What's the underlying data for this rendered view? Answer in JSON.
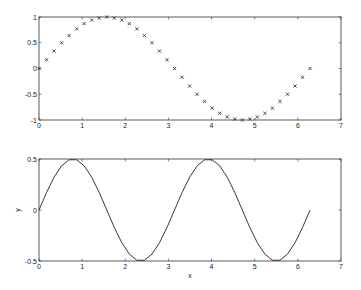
{
  "chart_data": [
    {
      "type": "scatter",
      "title": "",
      "xlabel": "",
      "ylabel": "",
      "xlim": [
        0,
        7
      ],
      "ylim": [
        -1,
        1
      ],
      "xticks": [
        "0",
        "1",
        "2",
        "3",
        "4",
        "5",
        "6",
        "7"
      ],
      "yticks": [
        "-1",
        "-0.5",
        "0",
        "0.5",
        "1"
      ],
      "marker": "x",
      "grid": false,
      "series": [
        {
          "name": "sin(x)",
          "x": [
            0,
            0.1745,
            0.3491,
            0.5236,
            0.6981,
            0.8727,
            1.0472,
            1.2217,
            1.3963,
            1.5708,
            1.7453,
            1.9199,
            2.0944,
            2.2689,
            2.4435,
            2.618,
            2.7925,
            2.9671,
            3.1416,
            3.3161,
            3.4907,
            3.6652,
            3.8397,
            4.0143,
            4.1888,
            4.3633,
            4.5379,
            4.7124,
            4.8869,
            5.0615,
            5.236,
            5.4105,
            5.5851,
            5.7596,
            5.9341,
            6.1087,
            6.2832
          ],
          "y": [
            0,
            0.17,
            0.34,
            0.5,
            0.64,
            0.77,
            0.87,
            0.94,
            0.98,
            1,
            0.98,
            0.94,
            0.87,
            0.77,
            0.64,
            0.5,
            0.34,
            0.17,
            0,
            -0.17,
            -0.34,
            -0.5,
            -0.64,
            -0.77,
            -0.87,
            -0.94,
            -0.98,
            -1,
            -0.98,
            -0.94,
            -0.87,
            -0.77,
            -0.64,
            -0.5,
            -0.34,
            -0.17,
            0
          ]
        }
      ]
    },
    {
      "type": "line",
      "title": "",
      "xlabel": "x",
      "ylabel": "y",
      "xlim": [
        0,
        7
      ],
      "ylim": [
        -0.5,
        0.5
      ],
      "xticks": [
        "0",
        "1",
        "2",
        "3",
        "4",
        "5",
        "6",
        "7"
      ],
      "yticks": [
        "-0.5",
        "0",
        "0.5"
      ],
      "grid": false,
      "series": [
        {
          "name": "0.5*sin(2x)",
          "x_range": [
            0,
            6.2832
          ],
          "points": 37,
          "function": "0.5*sin(2x)"
        }
      ]
    }
  ],
  "labels": {
    "top_xticks": [
      "0",
      "1",
      "2",
      "3",
      "4",
      "5",
      "6",
      "7"
    ],
    "top_yticks": [
      "-1",
      "-0.5",
      "0",
      "0.5",
      "1"
    ],
    "bottom_xticks": [
      "0",
      "1",
      "2",
      "3",
      "4",
      "5",
      "6",
      "7"
    ],
    "bottom_yticks": [
      "-0.5",
      "0",
      "0.5"
    ],
    "bottom_xlabel": "x",
    "bottom_ylabel": "y"
  },
  "colors": {
    "axis": "#333333",
    "data": "#222222",
    "background": "#ffffff"
  }
}
